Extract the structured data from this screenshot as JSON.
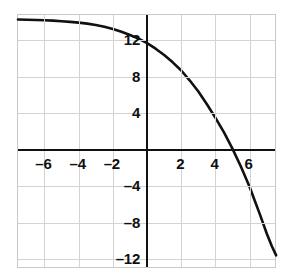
{
  "chart_data": {
    "type": "line",
    "title": "",
    "xlabel": "",
    "ylabel": "",
    "xlim": [
      -7.55,
      7.6
    ],
    "ylim": [
      -13.1,
      14.8
    ],
    "grid": true,
    "legend": null,
    "x_ticks": [
      -6,
      -4,
      -2,
      2,
      4,
      6
    ],
    "x_tick_labels": [
      "–6",
      "–4",
      "–2",
      "2",
      "4",
      "6"
    ],
    "y_ticks": [
      12,
      8,
      4,
      -4,
      -8,
      -12
    ],
    "y_tick_labels": [
      "12",
      "8",
      "4",
      "–4",
      "–8",
      "–12"
    ],
    "x_gridlines": [
      -6,
      -4,
      -2,
      0,
      2,
      4,
      6
    ],
    "y_gridlines": [
      12,
      8,
      4,
      0,
      -4,
      -8,
      -12
    ],
    "series": [
      {
        "name": "curve",
        "color": "#111111",
        "x": [
          -7.55,
          -7.0,
          -6.5,
          -6.0,
          -5.5,
          -5.0,
          -4.5,
          -4.0,
          -3.5,
          -3.0,
          -2.5,
          -2.0,
          -1.5,
          -1.0,
          -0.5,
          0.0,
          0.5,
          1.0,
          1.5,
          2.0,
          2.5,
          3.0,
          3.5,
          4.0,
          4.5,
          5.0,
          5.5,
          6.0,
          6.3,
          6.6,
          7.0,
          7.3,
          7.55
        ],
        "y": [
          14.3,
          14.28,
          14.25,
          14.22,
          14.18,
          14.12,
          14.05,
          13.96,
          13.85,
          13.7,
          13.5,
          13.25,
          12.95,
          12.6,
          12.2,
          11.7,
          11.1,
          10.4,
          9.6,
          8.7,
          7.6,
          6.4,
          5.0,
          3.5,
          1.9,
          0.1,
          -1.9,
          -4.1,
          -5.6,
          -7.1,
          -9.2,
          -10.6,
          -11.6
        ]
      }
    ],
    "annotations": []
  },
  "colors": {
    "axis": "#111111",
    "grid": "#d3d3d3",
    "curve": "#111111",
    "frame": "#c9c9c9",
    "background": "#ffffff",
    "label": "#101010"
  }
}
